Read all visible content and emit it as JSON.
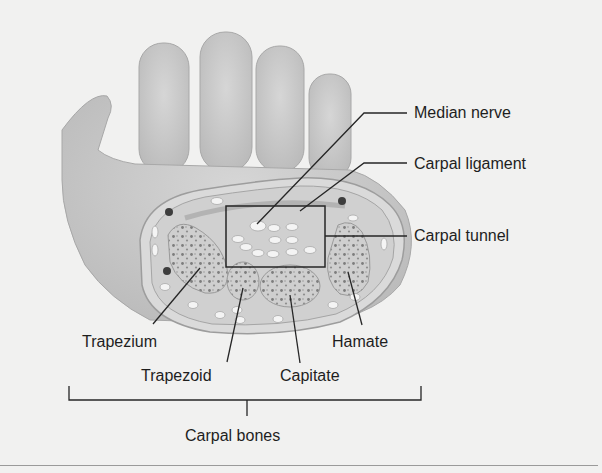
{
  "figure": {
    "labels": {
      "median_nerve": "Median nerve",
      "carpal_ligament": "Carpal ligament",
      "carpal_tunnel": "Carpal tunnel",
      "trapezium": "Trapezium",
      "trapezoid": "Trapezoid",
      "capitate": "Capitate",
      "hamate": "Hamate",
      "carpal_bones": "Carpal bones"
    },
    "colors": {
      "background": "#f1f1f0",
      "skin": "#c9c9c9",
      "tissue": "#d4d4d4",
      "bone": "#bdbdbd",
      "leader_line": "#1e1e1e"
    }
  }
}
